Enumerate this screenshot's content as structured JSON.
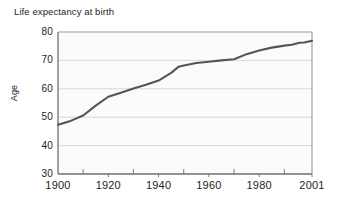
{
  "chart_data": {
    "type": "line",
    "title": "Life expectancy at birth",
    "xlabel": "",
    "ylabel": "Age",
    "xlim": [
      1900,
      2001
    ],
    "ylim": [
      30,
      80
    ],
    "yticks": [
      30,
      40,
      50,
      60,
      70,
      80
    ],
    "ytick_labels": [
      "30",
      "40",
      "50",
      "60",
      "70",
      "80"
    ],
    "xticks": [
      1900,
      1920,
      1940,
      1960,
      1980,
      2001
    ],
    "xtick_labels": [
      "1900",
      "1920",
      "1940",
      "1960",
      "1980",
      "2001"
    ],
    "minor_xticks": [
      1910,
      1930,
      1950,
      1970,
      1990
    ],
    "grid": "horizontal",
    "legend": "none",
    "series": [
      {
        "name": "Life expectancy at birth",
        "color": "#555555",
        "x": [
          1900,
          1905,
          1910,
          1915,
          1920,
          1925,
          1930,
          1935,
          1940,
          1945,
          1948,
          1950,
          1955,
          1960,
          1965,
          1970,
          1975,
          1980,
          1985,
          1990,
          1993,
          1996,
          1998,
          2001
        ],
        "values": [
          47.3,
          48.7,
          50.6,
          54.1,
          57.2,
          58.6,
          60.1,
          61.4,
          62.9,
          65.6,
          67.8,
          68.2,
          69.1,
          69.5,
          70.0,
          70.4,
          72.2,
          73.5,
          74.5,
          75.2,
          75.5,
          76.2,
          76.3,
          76.9
        ]
      }
    ]
  }
}
